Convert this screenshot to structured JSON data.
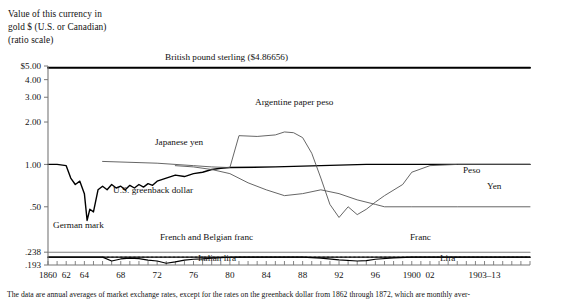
{
  "figure": {
    "axis_title_lines": [
      "Value of this currency in",
      "gold $ (U.S. or Canadian)",
      "(ratio scale)"
    ],
    "footnote": "The data are annual averages of market exchange rates, except for the rates on the greenback dollar from 1862 through 1872, which are monthly aver-"
  },
  "labels": {
    "pound": "British pound sterling ($4.86656)",
    "argentine_peso": "Argentine paper peso",
    "japanese_yen": "Japanese yen",
    "greenback": "U.S. greenback dollar",
    "peso_right": "Peso",
    "yen_right": "Yen",
    "german_mark": "German mark",
    "french_belgian_franc": "French and Belgian franc",
    "italian_lira": "Italian lira",
    "franc_right": "Franc",
    "lira_right": "Lira"
  },
  "chart_data": {
    "type": "line",
    "title": "",
    "subtitle": "",
    "xlabel": "",
    "ylabel": "Value of this currency in gold $ (U.S. or Canadian) (ratio scale)",
    "scale": "log",
    "grid": false,
    "legend": "inline-annotations",
    "ylim": [
      0.193,
      5.0
    ],
    "xlim": [
      1860,
      1913
    ],
    "ytick_labels": [
      "$5.00",
      "4.00",
      "3.00",
      "2.00",
      "1.00",
      ".50",
      ".238",
      ".193"
    ],
    "ytick_values": [
      5.0,
      4.0,
      3.0,
      2.0,
      1.0,
      0.5,
      0.238,
      0.193
    ],
    "xtick_labels": [
      "1860",
      "62",
      "64",
      "68",
      "72",
      "76",
      "80",
      "84",
      "88",
      "92",
      "96",
      "1900",
      "02",
      "1903–13"
    ],
    "xtick_values": [
      1860,
      1862,
      1864,
      1868,
      1872,
      1876,
      1880,
      1884,
      1888,
      1892,
      1896,
      1900,
      1902,
      1908
    ],
    "xtick_minor_step": 1,
    "series": [
      {
        "name": "British pound sterling",
        "note": "$4.86656",
        "color": "#000000",
        "width": 2.0,
        "x": [
          1860,
          1913
        ],
        "values": [
          4.86656,
          4.86656
        ]
      },
      {
        "name": "German mark",
        "color": "#808080",
        "width": 1.1,
        "x": [
          1860,
          1913
        ],
        "values": [
          0.238,
          0.238
        ]
      },
      {
        "name": "French and Belgian franc",
        "color": "#000000",
        "width": 1.4,
        "x": [
          1860,
          1913
        ],
        "values": [
          0.2195,
          0.2195
        ]
      },
      {
        "name": "U.S. greenback dollar / Japanese yen",
        "color": "#000000",
        "width": 1.4,
        "x": [
          1860,
          1861,
          1862,
          1862.5,
          1863,
          1863.5,
          1864,
          1864.3,
          1864.6,
          1865,
          1865.5,
          1866,
          1866.5,
          1867,
          1867.5,
          1868,
          1868.5,
          1869,
          1869.5,
          1870,
          1870.5,
          1871,
          1871.5,
          1872,
          1873,
          1874,
          1875,
          1876,
          1877,
          1878,
          1879,
          1880,
          1885,
          1890,
          1895,
          1897,
          1900,
          1905,
          1913
        ],
        "values": [
          1.0,
          1.0,
          0.98,
          0.8,
          0.72,
          0.76,
          0.62,
          0.4,
          0.48,
          0.46,
          0.66,
          0.7,
          0.66,
          0.72,
          0.68,
          0.7,
          0.66,
          0.71,
          0.68,
          0.72,
          0.69,
          0.73,
          0.71,
          0.76,
          0.8,
          0.84,
          0.82,
          0.86,
          0.88,
          0.92,
          0.94,
          0.95,
          0.96,
          0.98,
          1.0,
          1.0,
          1.0,
          1.0,
          1.0
        ]
      },
      {
        "name": "Argentine paper peso",
        "color": "#555555",
        "width": 0.9,
        "x": [
          1866,
          1872,
          1876,
          1878,
          1880,
          1881,
          1883,
          1885,
          1886,
          1887,
          1888,
          1889,
          1890,
          1891,
          1892,
          1893,
          1894,
          1895,
          1896,
          1897,
          1899,
          1900,
          1902,
          1905,
          1913
        ],
        "values": [
          1.05,
          1.02,
          0.98,
          0.96,
          0.95,
          1.6,
          1.58,
          1.62,
          1.7,
          1.68,
          1.55,
          1.2,
          0.8,
          0.52,
          0.42,
          0.5,
          0.44,
          0.48,
          0.54,
          0.6,
          0.72,
          0.88,
          0.98,
          1.0,
          1.0
        ]
      },
      {
        "name": "Japanese yen (depreciating)",
        "color": "#555555",
        "width": 0.9,
        "x": [
          1874,
          1876,
          1878,
          1880,
          1882,
          1884,
          1886,
          1888,
          1890,
          1892,
          1894,
          1896,
          1897,
          1900,
          1905,
          1913
        ],
        "values": [
          0.98,
          0.96,
          0.92,
          0.86,
          0.74,
          0.66,
          0.6,
          0.62,
          0.66,
          0.62,
          0.56,
          0.52,
          0.5,
          0.5,
          0.5,
          0.5
        ]
      },
      {
        "name": "Italian lira",
        "color": "#000000",
        "width": 1.2,
        "x": [
          1860,
          1866,
          1867,
          1868,
          1869,
          1870,
          1871,
          1872,
          1873,
          1874,
          1875,
          1876,
          1877,
          1878,
          1879,
          1880,
          1881,
          1884,
          1888,
          1890,
          1892,
          1894,
          1895,
          1896,
          1898,
          1900,
          1902,
          1906,
          1913
        ],
        "values": [
          0.2195,
          0.2195,
          0.206,
          0.213,
          0.216,
          0.214,
          0.209,
          0.206,
          0.1985,
          0.203,
          0.209,
          0.212,
          0.213,
          0.216,
          0.2175,
          0.219,
          0.2195,
          0.2195,
          0.2195,
          0.216,
          0.21,
          0.206,
          0.2075,
          0.212,
          0.217,
          0.2195,
          0.2195,
          0.2195,
          0.2195
        ]
      }
    ]
  }
}
